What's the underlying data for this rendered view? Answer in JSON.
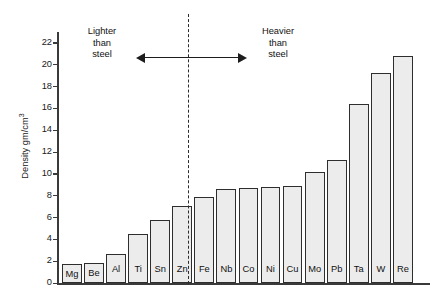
{
  "chart_data": {
    "type": "bar",
    "title": "",
    "xlabel": "",
    "ylabel": "Density gm/cm",
    "ylabel_exponent": "3",
    "ylim": [
      0,
      23
    ],
    "ytick_step": 2,
    "yticks": [
      0,
      2,
      4,
      6,
      8,
      10,
      12,
      14,
      16,
      18,
      20,
      22
    ],
    "grid": false,
    "legend": "none",
    "categories": [
      "Mg",
      "Be",
      "Al",
      "Ti",
      "Sn",
      "Zn",
      "Fe",
      "Nb",
      "Co",
      "Ni",
      "Cu",
      "Mo",
      "Pb",
      "Ta",
      "W",
      "Re"
    ],
    "values": [
      1.7,
      1.85,
      2.7,
      4.5,
      5.8,
      7.1,
      7.9,
      8.6,
      8.7,
      8.8,
      8.9,
      10.2,
      11.3,
      16.4,
      19.2,
      20.8
    ],
    "annotations": [
      {
        "id": "lighter",
        "text_lines": [
          "Lighter",
          "than",
          "steel"
        ],
        "arrow": "left",
        "side": "left-of-divider"
      },
      {
        "id": "heavier",
        "text_lines": [
          "Heavier",
          "than",
          "steel"
        ],
        "arrow": "right",
        "side": "right-of-divider"
      }
    ],
    "divider": {
      "style": "dashed",
      "at_category": "Fe",
      "note": "separates lighter-than-steel from heavier-than-steel"
    }
  },
  "colors": {
    "bar_fill": "#ececec",
    "bar_border": "#2e2e2e",
    "axis": "#3a3a3a",
    "text": "#111111",
    "divider": "#2b2b2b",
    "arrow": "#1d1d1d"
  }
}
